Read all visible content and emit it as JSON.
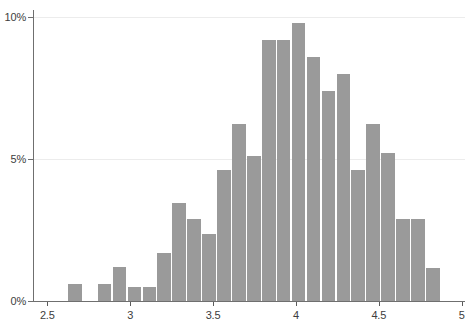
{
  "chart_data": {
    "type": "bar",
    "title": "",
    "subtitle": "",
    "xlabel": "",
    "ylabel": "",
    "grid": true,
    "legend": null,
    "xlim": [
      2.42,
      5.02
    ],
    "ylim": [
      0,
      10.25
    ],
    "y_tick_labels": [
      "0%",
      "5%",
      "10%"
    ],
    "y_tick_values": [
      0,
      5,
      10
    ],
    "x_tick_labels": [
      "2.5",
      "3",
      "3.5",
      "4",
      "4.5",
      "5"
    ],
    "x_tick_values": [
      2.5,
      3,
      3.5,
      4,
      4.5,
      5
    ],
    "bar_color": "#9a9a9a",
    "axis_color": "#6f6f6f",
    "grid_color": "#ececec",
    "bin_width": 0.09,
    "categories": [
      2.67,
      2.85,
      2.94,
      3.03,
      3.12,
      3.21,
      3.3,
      3.39,
      3.48,
      3.57,
      3.66,
      3.75,
      3.84,
      3.93,
      4.02,
      4.11,
      4.2,
      4.29,
      4.38,
      4.47,
      4.56,
      4.65,
      4.74,
      4.83,
      4.92
    ],
    "values": [
      0.6,
      0.6,
      1.2,
      0.5,
      0.5,
      1.7,
      3.45,
      2.9,
      2.35,
      4.6,
      6.25,
      5.1,
      9.2,
      9.2,
      9.8,
      8.6,
      7.4,
      8.0,
      4.6,
      6.25,
      5.2,
      2.9,
      2.9,
      1.15,
      0.0
    ]
  }
}
